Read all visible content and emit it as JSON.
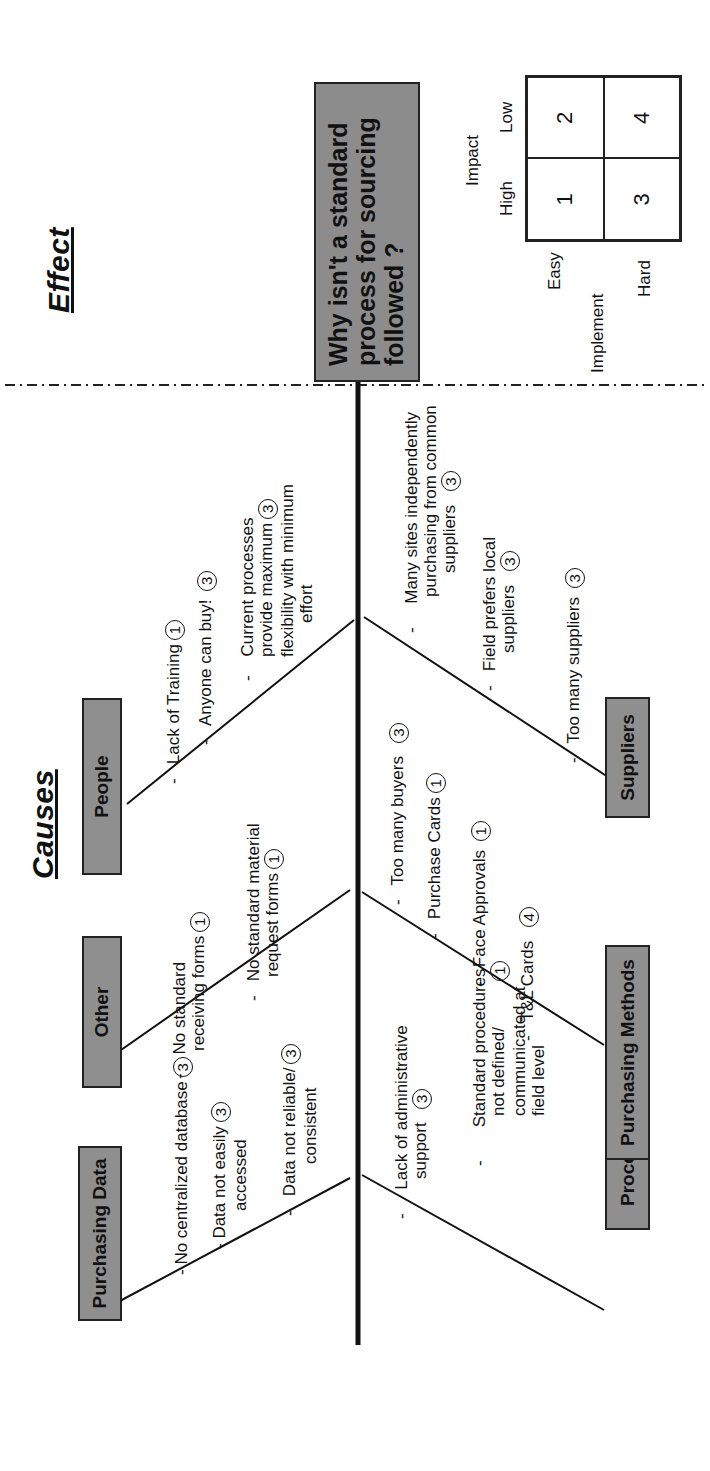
{
  "titles": {
    "causes": "Causes",
    "effect": "Effect"
  },
  "effect": {
    "lines": [
      "Why isn't a standard",
      "process for sourcing",
      "followed ?"
    ]
  },
  "priority_matrix": {
    "axis_impact": "Impact",
    "impact_high": "High",
    "impact_low": "Low",
    "axis_implement": "Implement",
    "implement_easy": "Easy",
    "implement_hard": "Hard",
    "cells": [
      "1",
      "2",
      "3",
      "4"
    ]
  },
  "categories": {
    "purchasing_data": {
      "label": "Purchasing Data",
      "causes": [
        {
          "lines": [
            "No centralized database"
          ],
          "rating": "3"
        },
        {
          "lines": [
            "Data not easily",
            "accessed"
          ],
          "rating": "3"
        },
        {
          "lines": [
            "Data not reliable/",
            "consistent"
          ],
          "rating": "3"
        }
      ]
    },
    "other": {
      "label": "Other",
      "causes": [
        {
          "lines": [
            "No standard",
            "receiving forms"
          ],
          "rating": "1"
        },
        {
          "lines": [
            "No standard material",
            "request forms"
          ],
          "rating": "1"
        }
      ]
    },
    "people": {
      "label": "People",
      "causes": [
        {
          "lines": [
            "Lack of Training"
          ],
          "rating": "1"
        },
        {
          "lines": [
            "Anyone can  buy!"
          ],
          "rating": "3"
        },
        {
          "lines": [
            "Current processes",
            "provide maximum",
            "flexibility with minimum",
            "effort"
          ],
          "rating": "3"
        }
      ]
    },
    "process": {
      "label": "Process",
      "causes": [
        {
          "lines": [
            "Lack of administrative",
            "support"
          ],
          "rating": "3"
        },
        {
          "lines": [
            "Standard procedures",
            "not defined/",
            "communicated at",
            "field level"
          ],
          "rating": "1"
        }
      ]
    },
    "purchasing_methods": {
      "label": "Purchasing Methods",
      "causes": [
        {
          "lines": [
            "Too many buyers"
          ],
          "rating": "3"
        },
        {
          "lines": [
            "Purchase Cards"
          ],
          "rating": "1"
        },
        {
          "lines": [
            "Face Approvals"
          ],
          "rating": "1"
        },
        {
          "lines": [
            "T&L Cards"
          ],
          "rating": "4"
        }
      ]
    },
    "suppliers": {
      "label": "Suppliers",
      "causes": [
        {
          "lines": [
            "Many sites independently",
            "purchasing from common",
            "suppliers"
          ],
          "rating": "3"
        },
        {
          "lines": [
            "Field prefers local",
            "suppliers"
          ],
          "rating": "3"
        },
        {
          "lines": [
            "Too many suppliers"
          ],
          "rating": "3"
        }
      ]
    }
  },
  "colors": {
    "box_fill": "#8f8f8f",
    "line": "#111111",
    "background": "#ffffff"
  }
}
